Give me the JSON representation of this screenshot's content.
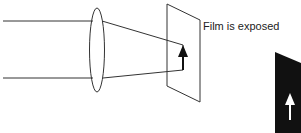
{
  "diagram": {
    "caption": "Film is exposed",
    "elements": [
      "incoming-rays",
      "lens",
      "converging-rays",
      "film-plane",
      "image-arrow",
      "developed-film-negative"
    ],
    "colors": {
      "line": "#333333",
      "negative": "#111111",
      "arrow_on_negative": "#ffffff"
    }
  }
}
